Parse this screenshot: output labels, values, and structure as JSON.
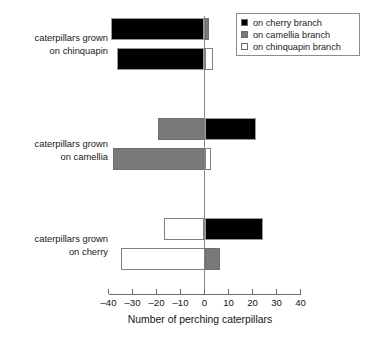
{
  "chart_data": {
    "type": "bar",
    "orientation": "horizontal",
    "title": "",
    "xlabel": "Number of perching caterpillars",
    "ylabel": "",
    "xlim": [
      -40,
      40
    ],
    "xticks": [
      -40,
      -30,
      -20,
      -10,
      0,
      10,
      20,
      30,
      40
    ],
    "xticklabels": [
      "–40",
      "–30",
      "–20",
      "–10",
      "0",
      "10",
      "20",
      "30",
      "40"
    ],
    "grid": false,
    "legend_position": "top-right",
    "legend": [
      {
        "label": "on cherry branch",
        "color": "#000000",
        "key": "cherry"
      },
      {
        "label": "on camellia branch",
        "color": "#797979",
        "key": "camellia"
      },
      {
        "label": "on chinquapin branch",
        "color": "#ffffff",
        "key": "chinquapin"
      }
    ],
    "groups": [
      {
        "id": "chinquapin",
        "label_line1": "caterpillars grown",
        "label_line2": "on chinquapin",
        "bars": [
          {
            "id": "chinquapin-bar-1",
            "segments": [
              {
                "series": "cherry",
                "fill": "black",
                "from": -39.0,
                "to": 0
              },
              {
                "series": "camellia",
                "fill": "gray",
                "from": 0,
                "to": 2.0
              }
            ]
          },
          {
            "id": "chinquapin-bar-2",
            "segments": [
              {
                "series": "cherry",
                "fill": "black",
                "from": -36.5,
                "to": 0
              },
              {
                "series": "chinquapin",
                "fill": "white",
                "from": 0,
                "to": 3.5
              }
            ]
          }
        ]
      },
      {
        "id": "camellia",
        "label_line1": "caterpillars grown",
        "label_line2": "on camellia",
        "bars": [
          {
            "id": "camellia-bar-1",
            "segments": [
              {
                "series": "camellia",
                "fill": "gray",
                "from": -19.5,
                "to": 0
              },
              {
                "series": "cherry",
                "fill": "black",
                "from": 0,
                "to": 21.5
              }
            ]
          },
          {
            "id": "camellia-bar-2",
            "segments": [
              {
                "series": "camellia",
                "fill": "gray",
                "from": -38.0,
                "to": 0
              },
              {
                "series": "chinquapin",
                "fill": "white",
                "from": 0,
                "to": 2.5
              }
            ]
          }
        ]
      },
      {
        "id": "cherry",
        "label_line1": "caterpillars grown",
        "label_line2": "on cherry",
        "bars": [
          {
            "id": "cherry-bar-1",
            "segments": [
              {
                "series": "chinquapin",
                "fill": "white",
                "from": -17.0,
                "to": 0
              },
              {
                "series": "cherry",
                "fill": "black",
                "from": 0,
                "to": 24.5
              }
            ]
          },
          {
            "id": "cherry-bar-2",
            "segments": [
              {
                "series": "chinquapin",
                "fill": "white",
                "from": -35.0,
                "to": 0
              },
              {
                "series": "camellia",
                "fill": "gray",
                "from": 0,
                "to": 6.5
              }
            ]
          }
        ]
      }
    ]
  },
  "axis": {
    "title": "Number of perching caterpillars"
  },
  "labels": {
    "group1_line1": "caterpillars grown",
    "group1_line2": "on chinquapin",
    "group2_line1": "caterpillars grown",
    "group2_line2": "on camellia",
    "group3_line1": "caterpillars grown",
    "group3_line2": "on cherry"
  },
  "legend": {
    "item1": "on cherry branch",
    "item2": "on camellia branch",
    "item3": "on chinquapin branch"
  },
  "ticks": {
    "t1": "–40",
    "t2": "–30",
    "t3": "–20",
    "t4": "–10",
    "t5": "0",
    "t6": "10",
    "t7": "20",
    "t8": "30",
    "t9": "40"
  }
}
